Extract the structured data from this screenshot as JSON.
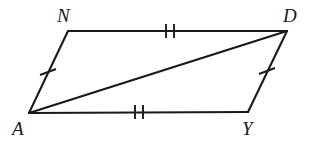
{
  "figure": {
    "shape_name": "parallelogram",
    "background_color": "#ffffff",
    "stroke_color": "#1a1a1a",
    "vertices": [
      {
        "label": "N",
        "x": 68,
        "y": 31,
        "label_x": 57,
        "label_y": 6
      },
      {
        "label": "D",
        "x": 287,
        "y": 31,
        "label_x": 283,
        "label_y": 6
      },
      {
        "label": "Y",
        "x": 248,
        "y": 112,
        "label_x": 242,
        "label_y": 119
      },
      {
        "label": "A",
        "x": 29,
        "y": 113,
        "label_x": 12,
        "label_y": 119
      }
    ],
    "edges": [
      {
        "name": "side-ND",
        "from": "N",
        "to": "D",
        "tick_count": 2
      },
      {
        "name": "side-DY",
        "from": "D",
        "to": "Y",
        "tick_count": 1
      },
      {
        "name": "side-YA",
        "from": "Y",
        "to": "A",
        "tick_count": 2
      },
      {
        "name": "side-AN",
        "from": "A",
        "to": "N",
        "tick_count": 1
      }
    ],
    "diagonal": {
      "name": "diagonal-AD",
      "from": "A",
      "to": "D"
    },
    "congruence_marks": [
      {
        "name": "tick-mark-nd",
        "edge": "ND",
        "count": 2,
        "cx": 170,
        "cy": 31,
        "angle_deg": 0
      },
      {
        "name": "tick-mark-ay",
        "edge": "AY",
        "count": 2,
        "cx": 139,
        "cy": 112,
        "angle_deg": 0
      },
      {
        "name": "tick-mark-an",
        "edge": "AN",
        "count": 1,
        "cx": 48,
        "cy": 72,
        "angle_deg": 65
      },
      {
        "name": "tick-mark-dy",
        "edge": "DY",
        "count": 1,
        "cx": 267,
        "cy": 71,
        "angle_deg": 64
      }
    ]
  }
}
